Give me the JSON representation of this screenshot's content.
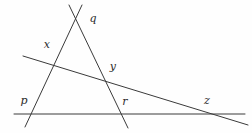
{
  "figure": {
    "background_color": "#fefefe",
    "line_color": "#3a3a3a",
    "label_color": "#2b2b2b",
    "width": 252,
    "height": 133,
    "labels": [
      {
        "id": "q",
        "text": "q",
        "x": 93,
        "y": 18
      },
      {
        "id": "x",
        "text": "x",
        "x": 47,
        "y": 44
      },
      {
        "id": "y",
        "text": "y",
        "x": 113,
        "y": 66
      },
      {
        "id": "p",
        "text": "p",
        "x": 24,
        "y": 100
      },
      {
        "id": "r",
        "text": "r",
        "x": 125,
        "y": 101
      },
      {
        "id": "z",
        "text": "z",
        "x": 207,
        "y": 100
      }
    ],
    "lines": [
      {
        "id": "line-left-ascending",
        "x1": 25,
        "y1": 127,
        "x2": 82,
        "y2": 5
      },
      {
        "id": "line-right-descending",
        "x1": 69,
        "y1": 5,
        "x2": 128,
        "y2": 128
      },
      {
        "id": "line-oblique-xyz",
        "x1": 23,
        "y1": 56,
        "x2": 248,
        "y2": 125
      },
      {
        "id": "line-horizontal-prz",
        "x1": 14,
        "y1": 114,
        "x2": 245,
        "y2": 114
      }
    ],
    "intersections": [
      {
        "id": "q",
        "x": 75,
        "y": 19
      },
      {
        "id": "x",
        "x": 50,
        "y": 63
      },
      {
        "id": "y",
        "x": 105,
        "y": 81
      },
      {
        "id": "p",
        "x": 31,
        "y": 114
      },
      {
        "id": "r",
        "x": 121,
        "y": 114
      },
      {
        "id": "z",
        "x": 206,
        "y": 114
      }
    ]
  }
}
